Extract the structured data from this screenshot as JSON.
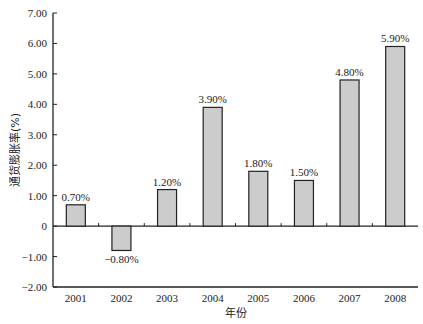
{
  "chart_data": {
    "type": "bar",
    "title": "",
    "xlabel": "年份",
    "ylabel": "通货膨胀率(%)",
    "categories": [
      "2001",
      "2002",
      "2003",
      "2004",
      "2005",
      "2006",
      "2007",
      "2008"
    ],
    "values": [
      0.7,
      -0.8,
      1.2,
      3.9,
      1.8,
      1.5,
      4.8,
      5.9
    ],
    "data_labels": [
      "0.70%",
      "-0.80%",
      "1.20%",
      "3.90%",
      "1.80%",
      "1.50%",
      "4.80%",
      "5.90%"
    ],
    "ylim": [
      -2.0,
      7.0
    ],
    "yticks": [
      7.0,
      6.0,
      5.0,
      4.0,
      3.0,
      2.0,
      1.0,
      0,
      -1.0,
      -2.0
    ],
    "ytick_labels": [
      "7.00",
      "6.00",
      "5.00",
      "4.00",
      "3.00",
      "2.00",
      "1.00",
      "0",
      "-1.00",
      "-2.00"
    ],
    "grid": false,
    "legend": null,
    "colors": {
      "bar_fill": "#cccccc",
      "bar_stroke": "#222222",
      "axis": "#222222"
    }
  }
}
